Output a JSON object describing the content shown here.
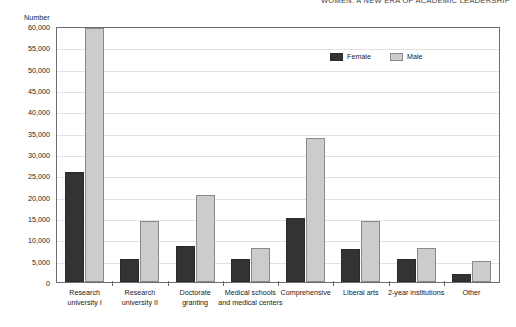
{
  "running_head": "WOMEN: A NEW ERA OF ACADEMIC LEADERSHIP",
  "axis": {
    "y_caption": "Number",
    "y_ticks": [
      "60,000",
      "55,000",
      "50,000",
      "45,000",
      "40,000",
      "35,000",
      "30,000",
      "25,000",
      "20,000",
      "15,000",
      "10,000",
      "5,000",
      "0"
    ]
  },
  "legend": {
    "position": "inside-top-right",
    "items": [
      {
        "name": "Female",
        "color": "#333333"
      },
      {
        "name": "Male",
        "color": "#cccccc"
      }
    ]
  },
  "chart_data": {
    "type": "bar",
    "title": "",
    "subtitle": "",
    "xlabel": "",
    "ylabel": "Number",
    "ylim": [
      0,
      60000
    ],
    "ytick_step": 5000,
    "grid": true,
    "legend_position": "inside-top-right",
    "categories": [
      "Research\nuniversity I",
      "Research\nuniversity II",
      "Doctorate\ngranting",
      "Medical schools\nand medical centers",
      "Comprehensive",
      "Liberal arts",
      "2-year institutions",
      "Other"
    ],
    "category_labels": [
      [
        "Research",
        "university I"
      ],
      [
        "Research",
        "university II"
      ],
      [
        "Doctorate",
        "granting"
      ],
      [
        "Medical schools",
        "and medical centers"
      ],
      [
        "Comprehensive"
      ],
      [
        "Liberal arts"
      ],
      [
        "2-year institutions"
      ],
      [
        "Other"
      ]
    ],
    "series": [
      {
        "name": "Female",
        "color": "#333333",
        "values": [
          26000,
          5500,
          8500,
          5500,
          15200,
          7700,
          5500,
          2000
        ]
      },
      {
        "name": "Male",
        "color": "#cccccc",
        "values": [
          60000,
          14500,
          20500,
          8000,
          34000,
          14500,
          8000,
          5000
        ]
      }
    ]
  }
}
